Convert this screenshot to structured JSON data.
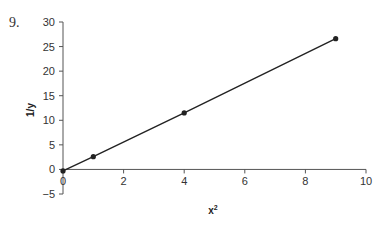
{
  "problem_number": "9.",
  "chart_data": {
    "type": "line",
    "title": "",
    "xlabel": "x²",
    "ylabel": "1/y",
    "xlim": [
      0,
      10
    ],
    "ylim": [
      -5,
      30
    ],
    "x_ticks": [
      0,
      2,
      4,
      6,
      8,
      10
    ],
    "y_ticks": [
      -5,
      0,
      5,
      10,
      15,
      20,
      25,
      30
    ],
    "grid": false,
    "legend": null,
    "series": [
      {
        "name": "1/y vs x²",
        "x": [
          0,
          1,
          4,
          9
        ],
        "y": [
          -0.3,
          2.6,
          11.5,
          26.6
        ],
        "markers": true,
        "color": "#222222"
      }
    ]
  }
}
